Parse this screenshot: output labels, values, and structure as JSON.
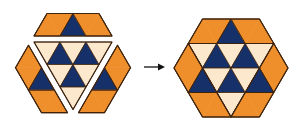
{
  "colors": {
    "orange": "#EF8F2C",
    "dark": "#16306A",
    "light": "#FBE8CD",
    "outline": "#3D230E",
    "arrow": "#111111",
    "background": "#FFFFFF"
  },
  "grid_note": "Triangle grid; u = half-unit horizontal offset from center, r = row index from top of hexagon",
  "figures": [
    {
      "name": "exploded-hexagon",
      "cx": 73,
      "top": 19.5,
      "s": 26,
      "h": 22.5,
      "pieces": [
        {
          "name": "top-piece",
          "offset": [
            0,
            -6
          ],
          "outline": [
            [
              -2,
              0
            ],
            [
              2,
              0
            ],
            [
              3,
              1
            ],
            [
              -3,
              1
            ]
          ],
          "triangles": [
            {
              "dir": "up",
              "u": -2,
              "r": 0,
              "color": "orange"
            },
            {
              "dir": "down",
              "u": -1,
              "r": 0,
              "color": "orange"
            },
            {
              "dir": "up",
              "u": 0,
              "r": 0,
              "color": "dark"
            },
            {
              "dir": "down",
              "u": 1,
              "r": 0,
              "color": "orange"
            },
            {
              "dir": "up",
              "u": 2,
              "r": 0,
              "color": "orange"
            }
          ],
          "parallelograms": [
            [
              [
                -2,
                0
              ],
              [
                0,
                0
              ],
              [
                -1,
                1
              ],
              [
                -3,
                1
              ]
            ],
            [
              [
                0,
                0
              ],
              [
                2,
                0
              ],
              [
                3,
                1
              ],
              [
                1,
                1
              ]
            ]
          ]
        },
        {
          "name": "center-inverted-triangle",
          "offset": [
            0,
            0
          ],
          "outline": [
            [
              -3,
              1
            ],
            [
              3,
              1
            ],
            [
              0,
              4
            ]
          ],
          "triangles": [
            {
              "dir": "down",
              "u": -2,
              "r": 1,
              "color": "light"
            },
            {
              "dir": "up",
              "u": -1,
              "r": 1,
              "color": "dark"
            },
            {
              "dir": "down",
              "u": 0,
              "r": 1,
              "color": "light"
            },
            {
              "dir": "up",
              "u": 1,
              "r": 1,
              "color": "dark"
            },
            {
              "dir": "down",
              "u": 2,
              "r": 1,
              "color": "light"
            },
            {
              "dir": "down",
              "u": -1,
              "r": 2,
              "color": "light"
            },
            {
              "dir": "up",
              "u": 0,
              "r": 2,
              "color": "dark"
            },
            {
              "dir": "down",
              "u": 1,
              "r": 2,
              "color": "light"
            },
            {
              "dir": "down",
              "u": 0,
              "r": 3,
              "color": "light"
            }
          ],
          "parallelograms": []
        },
        {
          "name": "left-piece",
          "offset": [
            -5.5,
            3.2
          ],
          "outline": [
            [
              -3,
              1
            ],
            [
              -4,
              2
            ],
            [
              -2,
              4
            ],
            [
              0,
              4
            ],
            [
              -1,
              3
            ],
            [
              -3,
              1
            ]
          ],
          "triangles": [
            {
              "dir": "up",
              "u": -3,
              "r": 1,
              "color": "orange"
            },
            {
              "dir": "down",
              "u": -3,
              "r": 2,
              "color": "orange"
            },
            {
              "dir": "up",
              "u": -2,
              "r": 2,
              "color": "dark"
            },
            {
              "dir": "down",
              "u": -2,
              "r": 3,
              "color": "orange"
            },
            {
              "dir": "up",
              "u": -1,
              "r": 3,
              "color": "orange"
            }
          ],
          "parallelograms": [
            [
              [
                -3,
                1
              ],
              [
                -2,
                2
              ],
              [
                -3,
                3
              ],
              [
                -4,
                2
              ]
            ],
            [
              [
                -3,
                3
              ],
              [
                -1,
                3
              ],
              [
                0,
                4
              ],
              [
                -2,
                4
              ]
            ]
          ]
        },
        {
          "name": "right-piece",
          "offset": [
            5.5,
            3.2
          ],
          "outline": [
            [
              3,
              1
            ],
            [
              4,
              2
            ],
            [
              2,
              4
            ],
            [
              0,
              4
            ],
            [
              1,
              3
            ],
            [
              3,
              1
            ]
          ],
          "triangles": [
            {
              "dir": "up",
              "u": 3,
              "r": 1,
              "color": "orange"
            },
            {
              "dir": "down",
              "u": 3,
              "r": 2,
              "color": "orange"
            },
            {
              "dir": "up",
              "u": 2,
              "r": 2,
              "color": "dark"
            },
            {
              "dir": "down",
              "u": 2,
              "r": 3,
              "color": "orange"
            },
            {
              "dir": "up",
              "u": 1,
              "r": 3,
              "color": "orange"
            }
          ],
          "parallelograms": [
            [
              [
                3,
                1
              ],
              [
                4,
                2
              ],
              [
                3,
                3
              ],
              [
                2,
                2
              ]
            ],
            [
              [
                1,
                3
              ],
              [
                3,
                3
              ],
              [
                2,
                4
              ],
              [
                0,
                4
              ]
            ]
          ]
        }
      ]
    },
    {
      "name": "assembled-hexagon",
      "cx": 231,
      "top": 19,
      "s": 28.5,
      "h": 24.5,
      "pieces": [
        {
          "name": "top-piece",
          "offset": [
            0,
            0
          ],
          "outline": [
            [
              -2,
              0
            ],
            [
              2,
              0
            ],
            [
              3,
              1
            ],
            [
              -3,
              1
            ]
          ],
          "triangles": [
            {
              "dir": "up",
              "u": -2,
              "r": 0,
              "color": "orange"
            },
            {
              "dir": "down",
              "u": -1,
              "r": 0,
              "color": "orange"
            },
            {
              "dir": "up",
              "u": 0,
              "r": 0,
              "color": "dark"
            },
            {
              "dir": "down",
              "u": 1,
              "r": 0,
              "color": "orange"
            },
            {
              "dir": "up",
              "u": 2,
              "r": 0,
              "color": "orange"
            }
          ],
          "parallelograms": [
            [
              [
                -2,
                0
              ],
              [
                0,
                0
              ],
              [
                -1,
                1
              ],
              [
                -3,
                1
              ]
            ],
            [
              [
                0,
                0
              ],
              [
                2,
                0
              ],
              [
                3,
                1
              ],
              [
                1,
                1
              ]
            ]
          ]
        },
        {
          "name": "center-inverted-triangle",
          "offset": [
            0,
            0
          ],
          "outline": [
            [
              -3,
              1
            ],
            [
              3,
              1
            ],
            [
              0,
              4
            ]
          ],
          "triangles": [
            {
              "dir": "down",
              "u": -2,
              "r": 1,
              "color": "light"
            },
            {
              "dir": "up",
              "u": -1,
              "r": 1,
              "color": "dark"
            },
            {
              "dir": "down",
              "u": 0,
              "r": 1,
              "color": "light"
            },
            {
              "dir": "up",
              "u": 1,
              "r": 1,
              "color": "dark"
            },
            {
              "dir": "down",
              "u": 2,
              "r": 1,
              "color": "light"
            },
            {
              "dir": "down",
              "u": -1,
              "r": 2,
              "color": "light"
            },
            {
              "dir": "up",
              "u": 0,
              "r": 2,
              "color": "dark"
            },
            {
              "dir": "down",
              "u": 1,
              "r": 2,
              "color": "light"
            },
            {
              "dir": "down",
              "u": 0,
              "r": 3,
              "color": "light"
            }
          ],
          "parallelograms": []
        },
        {
          "name": "left-piece",
          "offset": [
            0,
            0
          ],
          "outline": [
            [
              -3,
              1
            ],
            [
              -4,
              2
            ],
            [
              -2,
              4
            ],
            [
              0,
              4
            ],
            [
              -1,
              3
            ],
            [
              -3,
              1
            ]
          ],
          "triangles": [
            {
              "dir": "up",
              "u": -3,
              "r": 1,
              "color": "orange"
            },
            {
              "dir": "down",
              "u": -3,
              "r": 2,
              "color": "orange"
            },
            {
              "dir": "up",
              "u": -2,
              "r": 2,
              "color": "dark"
            },
            {
              "dir": "down",
              "u": -2,
              "r": 3,
              "color": "orange"
            },
            {
              "dir": "up",
              "u": -1,
              "r": 3,
              "color": "orange"
            }
          ],
          "parallelograms": [
            [
              [
                -3,
                1
              ],
              [
                -2,
                2
              ],
              [
                -3,
                3
              ],
              [
                -4,
                2
              ]
            ],
            [
              [
                -3,
                3
              ],
              [
                -1,
                3
              ],
              [
                0,
                4
              ],
              [
                -2,
                4
              ]
            ]
          ]
        },
        {
          "name": "right-piece",
          "offset": [
            0,
            0
          ],
          "outline": [
            [
              3,
              1
            ],
            [
              4,
              2
            ],
            [
              2,
              4
            ],
            [
              0,
              4
            ],
            [
              1,
              3
            ],
            [
              3,
              1
            ]
          ],
          "triangles": [
            {
              "dir": "up",
              "u": 3,
              "r": 1,
              "color": "orange"
            },
            {
              "dir": "down",
              "u": 3,
              "r": 2,
              "color": "orange"
            },
            {
              "dir": "up",
              "u": 2,
              "r": 2,
              "color": "dark"
            },
            {
              "dir": "down",
              "u": 2,
              "r": 3,
              "color": "orange"
            },
            {
              "dir": "up",
              "u": 1,
              "r": 3,
              "color": "orange"
            }
          ],
          "parallelograms": [
            [
              [
                3,
                1
              ],
              [
                4,
                2
              ],
              [
                3,
                3
              ],
              [
                2,
                2
              ]
            ],
            [
              [
                1,
                3
              ],
              [
                3,
                3
              ],
              [
                2,
                4
              ],
              [
                0,
                4
              ]
            ]
          ]
        }
      ]
    }
  ],
  "arrow": {
    "x1": 144,
    "y1": 67,
    "x2": 165,
    "y2": 67,
    "direction": "right"
  }
}
